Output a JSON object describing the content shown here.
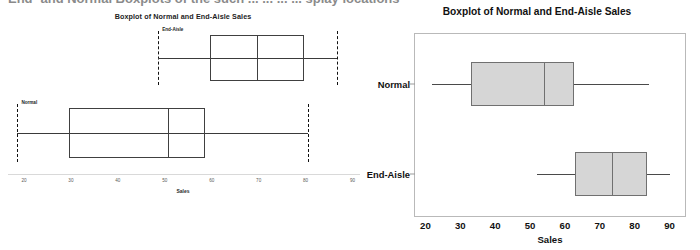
{
  "page": {
    "clipped_heading_text": "End- and Normal Boxplots of the such ... ... ... ... splay locations"
  },
  "chart_data": [
    {
      "id": "left",
      "type": "boxplot",
      "title": "Boxplot of Normal and End-Aisle Sales",
      "xlabel": "Sales",
      "ylabel": "",
      "orientation": "horizontal",
      "xlim": [
        20,
        95
      ],
      "xticks": [
        20,
        30,
        40,
        50,
        60,
        70,
        80,
        90
      ],
      "grid": false,
      "legend": "none",
      "style": "excel-outline",
      "groups": [
        {
          "name": "End-Aisle",
          "label": "End-Aisle",
          "min": 52,
          "q1": 63,
          "median": 73,
          "q3": 83,
          "max": 90
        },
        {
          "name": "Normal",
          "label": "Normal",
          "min": 22,
          "q1": 33,
          "median": 54,
          "q3": 62,
          "max": 84
        }
      ]
    },
    {
      "id": "right",
      "type": "boxplot",
      "title": "Boxplot of Normal and End-Aisle Sales",
      "xlabel": "Sales",
      "ylabel": "",
      "orientation": "horizontal",
      "xlim": [
        17,
        95
      ],
      "xticks": [
        20,
        30,
        40,
        50,
        60,
        70,
        80,
        90
      ],
      "grid": false,
      "legend": "none",
      "style": "minitab-filled",
      "box_fill": "#d6d6d6",
      "box_stroke": "#707070",
      "groups": [
        {
          "name": "Normal",
          "label": "Normal",
          "min": 22,
          "q1": 33,
          "median": 54,
          "q3": 62.5,
          "max": 84
        },
        {
          "name": "End-Aisle",
          "label": "End-Aisle",
          "min": 52,
          "q1": 63,
          "median": 73.5,
          "q3": 83.5,
          "max": 90
        }
      ]
    }
  ]
}
